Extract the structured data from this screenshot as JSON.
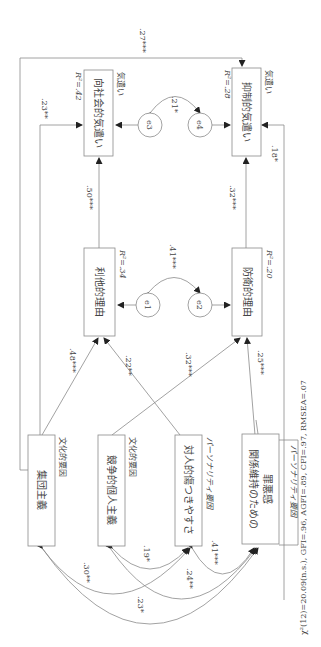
{
  "diagram": {
    "type": "path-diagram",
    "orientation": "rotated-90-clockwise",
    "outcome_group_label": "気遣い",
    "variables": {
      "prosocial_care": {
        "label": "向社会的気遣い",
        "r2": "R²=.42",
        "group": "気遣い"
      },
      "inhibitory_care": {
        "label": "抑制的気遣い",
        "r2": "R²=.28",
        "group": "気遣い"
      },
      "altruistic_reason": {
        "label": "利他的理由",
        "r2": "R²=.34"
      },
      "defensive_reason": {
        "label": "防衛的理由",
        "r2": "R²=.20"
      },
      "collectivism": {
        "label": "集団主義",
        "group": "文化的要因"
      },
      "competitive_individualism": {
        "label": "競争的個人主義",
        "group": "文化的要因"
      },
      "interpersonal_vulnerability": {
        "label": "対人的傷つきやすさ",
        "group": "パーソナリティ要因"
      },
      "guilt_line1": "関係維持のための",
      "guilt_line2": "罪悪感",
      "guilt_group": "パーソナリティ要因"
    },
    "errors": {
      "e1": "e1",
      "e2": "e2",
      "e3": "e3",
      "e4": "e4"
    },
    "paths": {
      "collectivism_to_prosocial": ".23**",
      "collectivism_to_inhibitory": ".27***",
      "altruistic_to_prosocial": ".50***",
      "defensive_to_inhibitory": ".32***",
      "guilt_to_inhibitory": ".18*",
      "collectivism_to_altruistic": ".48***",
      "vulnerability_to_altruistic": ".22**",
      "individualism_to_defensive": ".32***",
      "guilt_to_defensive": ".25***"
    },
    "covariances": {
      "e3_e4": ".21*",
      "e1_e2": ".41***",
      "collectivism_vulnerability": ".30**",
      "collectivism_guilt": ".23*",
      "individualism_vulnerability": ".19*",
      "individualism_guilt": ".24**",
      "vulnerability_guilt": ".41***"
    },
    "fit": "χ²(12)=20.09(n.s.), GFI=.96, AGFI=.89, CFI=.97, RMSEA=.07"
  }
}
